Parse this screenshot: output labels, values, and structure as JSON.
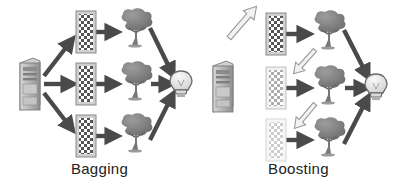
{
  "figure": {
    "background_color": "#ffffff",
    "width": 398,
    "height": 193,
    "panels": [
      {
        "id": "bagging",
        "caption": "Bagging",
        "caption_color": "#222222",
        "source": {
          "icon": "server-icon",
          "label": "Dataset server",
          "x": 28,
          "y": 84,
          "fill": "#b5b5b5",
          "stroke": "#6f6f6f"
        },
        "samples": [
          {
            "icon": "checkerboard-sample-icon",
            "label": "Bootstrap sample 1",
            "x": 85,
            "y": 32,
            "shade": "#5a5a5a",
            "opacity": 1.0
          },
          {
            "icon": "checkerboard-sample-icon",
            "label": "Bootstrap sample 2",
            "x": 85,
            "y": 84,
            "shade": "#5a5a5a",
            "opacity": 1.0
          },
          {
            "icon": "checkerboard-sample-icon",
            "label": "Bootstrap sample 3",
            "x": 85,
            "y": 136,
            "shade": "#5a5a5a",
            "opacity": 1.0
          }
        ],
        "learners": [
          {
            "icon": "decision-tree-icon",
            "label": "Decision tree 1",
            "x": 133,
            "y": 30
          },
          {
            "icon": "decision-tree-icon",
            "label": "Decision tree 2",
            "x": 133,
            "y": 84
          },
          {
            "icon": "decision-tree-icon",
            "label": "Decision tree 3",
            "x": 133,
            "y": 136
          }
        ],
        "result": {
          "icon": "lightbulb-icon",
          "label": "Aggregated prediction",
          "x": 181,
          "y": 84,
          "fill": "#e8e8e8",
          "stroke": "#6a6a6a"
        },
        "arrows": [
          {
            "name": "arrow-source-to-sample-1",
            "style": "solid-dark",
            "color": "#4a4a4a",
            "from": [
              44,
              76
            ],
            "to": [
              74,
              38
            ]
          },
          {
            "name": "arrow-source-to-sample-2",
            "style": "solid-dark",
            "color": "#4a4a4a",
            "from": [
              44,
              84
            ],
            "to": [
              74,
              84
            ]
          },
          {
            "name": "arrow-source-to-sample-3",
            "style": "solid-dark",
            "color": "#4a4a4a",
            "from": [
              44,
              93
            ],
            "to": [
              74,
              131
            ]
          },
          {
            "name": "arrow-sample-1-to-tree-1",
            "style": "solid-dark",
            "color": "#4a4a4a",
            "from": [
              96,
              32
            ],
            "to": [
              119,
              32
            ]
          },
          {
            "name": "arrow-sample-2-to-tree-2",
            "style": "solid-dark",
            "color": "#4a4a4a",
            "from": [
              96,
              84
            ],
            "to": [
              119,
              84
            ]
          },
          {
            "name": "arrow-sample-3-to-tree-3",
            "style": "solid-dark",
            "color": "#4a4a4a",
            "from": [
              96,
              136
            ],
            "to": [
              119,
              136
            ]
          },
          {
            "name": "arrow-tree-1-to-result",
            "style": "solid-dark",
            "color": "#4a4a4a",
            "from": [
              150,
              28
            ],
            "to": [
              174,
              76
            ]
          },
          {
            "name": "arrow-tree-2-to-result",
            "style": "solid-dark",
            "color": "#4a4a4a",
            "from": [
              152,
              84
            ],
            "to": [
              172,
              84
            ]
          },
          {
            "name": "arrow-tree-3-to-result",
            "style": "solid-dark",
            "color": "#4a4a4a",
            "from": [
              150,
              140
            ],
            "to": [
              174,
              93
            ]
          }
        ]
      },
      {
        "id": "boosting",
        "caption": "Boosting",
        "caption_color": "#222222",
        "source": {
          "icon": "server-icon",
          "label": "Dataset server",
          "x": 22,
          "y": 86,
          "fill": "#b5b5b5",
          "stroke": "#6f6f6f"
        },
        "samples": [
          {
            "icon": "checkerboard-sample-icon",
            "label": "Weighted sample 1",
            "x": 75,
            "y": 34,
            "shade": "#5a5a5a",
            "opacity": 1.0
          },
          {
            "icon": "checkerboard-sample-icon",
            "label": "Weighted sample 2",
            "x": 75,
            "y": 88,
            "shade": "#9e9e9e",
            "opacity": 0.55
          },
          {
            "icon": "checkerboard-sample-icon",
            "label": "Weighted sample 3",
            "x": 75,
            "y": 138,
            "shade": "#bdbdbd",
            "opacity": 0.38
          }
        ],
        "learners": [
          {
            "icon": "decision-tree-icon",
            "label": "Weak learner 1",
            "x": 128,
            "y": 32
          },
          {
            "icon": "decision-tree-icon",
            "label": "Weak learner 2",
            "x": 128,
            "y": 88
          },
          {
            "icon": "decision-tree-icon",
            "label": "Weak learner 3",
            "x": 128,
            "y": 140
          }
        ],
        "result": {
          "icon": "lightbulb-icon",
          "label": "Combined prediction",
          "x": 176,
          "y": 86,
          "fill": "#e8e8e8",
          "stroke": "#6a6a6a"
        },
        "arrows": [
          {
            "name": "arrow-source-to-sample-1",
            "style": "hollow-light",
            "color": "#9a9a9a",
            "from": [
              36,
              80
            ],
            "to": [
              66,
              42
            ]
          },
          {
            "name": "arrow-sample-1-to-tree-1",
            "style": "solid-dark",
            "color": "#4a4a4a",
            "from": [
              88,
              34
            ],
            "to": [
              112,
              34
            ]
          },
          {
            "name": "arrow-tree-1-to-sample-2",
            "style": "hollow-light",
            "color": "#9a9a9a",
            "from": [
              114,
              48
            ],
            "to": [
              88,
              78
            ]
          },
          {
            "name": "arrow-sample-2-to-tree-2",
            "style": "solid-dark",
            "color": "#4a4a4a",
            "from": [
              88,
              88
            ],
            "to": [
              112,
              88
            ]
          },
          {
            "name": "arrow-tree-2-to-sample-3",
            "style": "hollow-light",
            "color": "#9a9a9a",
            "from": [
              114,
              102
            ],
            "to": [
              88,
              130
            ]
          },
          {
            "name": "arrow-sample-3-to-tree-3",
            "style": "solid-dark",
            "color": "#4a4a4a",
            "from": [
              88,
              140
            ],
            "to": [
              112,
              140
            ]
          },
          {
            "name": "arrow-tree-1-to-result",
            "style": "solid-dark",
            "color": "#4a4a4a",
            "from": [
              146,
              30
            ],
            "to": [
              170,
              78
            ]
          },
          {
            "name": "arrow-tree-2-to-result",
            "style": "solid-dark",
            "color": "#4a4a4a",
            "from": [
              148,
              88
            ],
            "to": [
              168,
              88
            ]
          },
          {
            "name": "arrow-tree-3-to-result",
            "style": "solid-dark",
            "color": "#4a4a4a",
            "from": [
              146,
              142
            ],
            "to": [
              170,
              95
            ]
          }
        ]
      }
    ]
  }
}
